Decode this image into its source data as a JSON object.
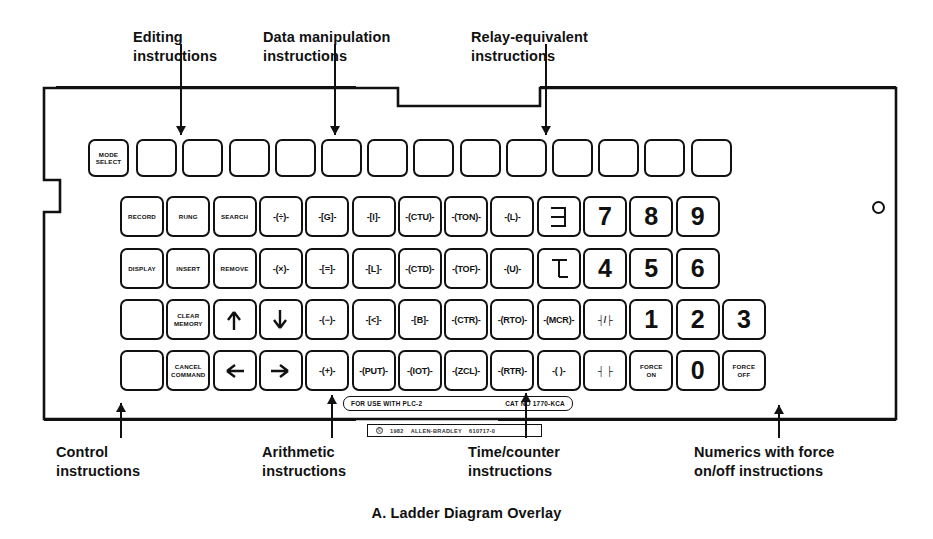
{
  "figure": {
    "caption": "A. Ladder Diagram Overlay",
    "device": "Allen-Bradley PLC-2 ladder diagram keyboard overlay"
  },
  "callouts": {
    "top": [
      {
        "id": "editing",
        "label": "Editing\ninstructions",
        "x": 133,
        "y": 28,
        "line_x": 180,
        "line_top": 44,
        "line_bottom": 135
      },
      {
        "id": "data-manipulation",
        "label": "Data manipulation\ninstructions",
        "x": 263,
        "y": 28,
        "line_x": 334,
        "line_top": 44,
        "line_bottom": 135
      },
      {
        "id": "relay-equivalent",
        "label": "Relay-equivalent\ninstructions",
        "x": 471,
        "y": 28,
        "line_x": 545,
        "line_top": 44,
        "line_bottom": 135
      }
    ],
    "bottom": [
      {
        "id": "control",
        "label": "Control\ninstructions",
        "x": 56,
        "y": 443,
        "line_x": 120,
        "line_top": 403,
        "line_bottom": 438
      },
      {
        "id": "arithmetic",
        "label": "Arithmetic\ninstructions",
        "x": 262,
        "y": 443,
        "line_x": 331,
        "line_top": 395,
        "line_bottom": 438
      },
      {
        "id": "time-counter",
        "label": "Time/counter\ninstructions",
        "x": 468,
        "y": 443,
        "line_x": 525,
        "line_top": 393,
        "line_bottom": 438
      },
      {
        "id": "numerics-force",
        "label": "Numerics with force\non/off instructions",
        "x": 694,
        "y": 443,
        "line_x": 778,
        "line_top": 405,
        "line_bottom": 438
      }
    ]
  },
  "strips": {
    "plc": "FOR USE WITH PLC-2",
    "cat": "CAT  NO  1770-KCA",
    "copyright_mark": "©",
    "copyright_year": "1982",
    "brand": "ALLEN-BRADLEY",
    "part": "610717-0"
  },
  "keyboard": {
    "rows": [
      {
        "id": "row-1",
        "keys": [
          {
            "t": "word",
            "v": "MODE\nSELECT",
            "n": "mode-select"
          },
          {
            "t": "blank",
            "v": "",
            "n": "blank-1"
          },
          {
            "t": "blank",
            "v": "",
            "n": "blank-2"
          },
          {
            "t": "blank",
            "v": "",
            "n": "blank-3"
          },
          {
            "t": "blank",
            "v": "",
            "n": "blank-4"
          },
          {
            "t": "blank",
            "v": "",
            "n": "blank-5"
          },
          {
            "t": "blank",
            "v": "",
            "n": "blank-6"
          },
          {
            "t": "blank",
            "v": "",
            "n": "blank-7"
          },
          {
            "t": "blank",
            "v": "",
            "n": "blank-8"
          },
          {
            "t": "blank",
            "v": "",
            "n": "blank-9"
          },
          {
            "t": "blank",
            "v": "",
            "n": "blank-10"
          },
          {
            "t": "blank",
            "v": "",
            "n": "blank-11"
          },
          {
            "t": "blank",
            "v": "",
            "n": "blank-12"
          },
          {
            "t": "blank",
            "v": "",
            "n": "blank-13"
          }
        ]
      },
      {
        "id": "row-2",
        "keys": [
          {
            "t": "word",
            "v": "RECORD",
            "n": "record"
          },
          {
            "t": "word",
            "v": "RUNG",
            "n": "rung"
          },
          {
            "t": "word",
            "v": "SEARCH",
            "n": "search"
          },
          {
            "t": "instr",
            "v": "-(÷)-",
            "n": "divide"
          },
          {
            "t": "instr",
            "v": "-[G]-",
            "n": "get"
          },
          {
            "t": "instr",
            "v": "-[I]-",
            "n": "input"
          },
          {
            "t": "instr",
            "v": "-(CTU)-",
            "n": "ctu"
          },
          {
            "t": "instr",
            "v": "-(TON)-",
            "n": "ton"
          },
          {
            "t": "instr",
            "v": "-(L)-",
            "n": "latch"
          },
          {
            "t": "sym",
            "v": "branch-start",
            "n": "branch-start"
          },
          {
            "t": "num",
            "v": "7",
            "n": "digit-7"
          },
          {
            "t": "num",
            "v": "8",
            "n": "digit-8"
          },
          {
            "t": "num",
            "v": "9",
            "n": "digit-9"
          }
        ]
      },
      {
        "id": "row-3",
        "keys": [
          {
            "t": "word",
            "v": "DISPLAY",
            "n": "display"
          },
          {
            "t": "word",
            "v": "INSERT",
            "n": "insert"
          },
          {
            "t": "word",
            "v": "REMOVE",
            "n": "remove"
          },
          {
            "t": "instr",
            "v": "-(×)-",
            "n": "multiply"
          },
          {
            "t": "instr",
            "v": "-[=]-",
            "n": "equal"
          },
          {
            "t": "instr",
            "v": "-[L]-",
            "n": "limit"
          },
          {
            "t": "instr",
            "v": "-(CTD)-",
            "n": "ctd"
          },
          {
            "t": "instr",
            "v": "-(TOF)-",
            "n": "tof"
          },
          {
            "t": "instr",
            "v": "-(U)-",
            "n": "unlatch"
          },
          {
            "t": "sym",
            "v": "branch-end",
            "n": "branch-end"
          },
          {
            "t": "num",
            "v": "4",
            "n": "digit-4"
          },
          {
            "t": "num",
            "v": "5",
            "n": "digit-5"
          },
          {
            "t": "num",
            "v": "6",
            "n": "digit-6"
          }
        ]
      },
      {
        "id": "row-4",
        "keys": [
          {
            "t": "blank",
            "v": "",
            "n": "blank-14"
          },
          {
            "t": "word",
            "v": "CLEAR\nMEMORY",
            "n": "clear-memory"
          },
          {
            "t": "arrow",
            "v": "up",
            "n": "arrow-up"
          },
          {
            "t": "arrow",
            "v": "down",
            "n": "arrow-down"
          },
          {
            "t": "instr",
            "v": "-(−)-",
            "n": "subtract"
          },
          {
            "t": "instr",
            "v": "-[<]-",
            "n": "less-than"
          },
          {
            "t": "instr",
            "v": "-[B]-",
            "n": "bit"
          },
          {
            "t": "instr",
            "v": "-(CTR)-",
            "n": "ctr"
          },
          {
            "t": "instr",
            "v": "-(RTO)-",
            "n": "rto"
          },
          {
            "t": "instr",
            "v": "-(MCR)-",
            "n": "mcr"
          },
          {
            "t": "instr",
            "v": "┤/├",
            "n": "contact-nc"
          },
          {
            "t": "num",
            "v": "1",
            "n": "digit-1"
          },
          {
            "t": "num",
            "v": "2",
            "n": "digit-2"
          },
          {
            "t": "num",
            "v": "3",
            "n": "digit-3"
          }
        ]
      },
      {
        "id": "row-5",
        "keys": [
          {
            "t": "blank",
            "v": "",
            "n": "blank-15"
          },
          {
            "t": "word",
            "v": "CANCEL\nCOMMAND",
            "n": "cancel-command"
          },
          {
            "t": "arrow",
            "v": "left",
            "n": "arrow-left"
          },
          {
            "t": "arrow",
            "v": "right",
            "n": "arrow-right"
          },
          {
            "t": "instr",
            "v": "-(+)-",
            "n": "add"
          },
          {
            "t": "instr",
            "v": "-(PUT)-",
            "n": "put"
          },
          {
            "t": "instr",
            "v": "-(IOT)-",
            "n": "iot"
          },
          {
            "t": "instr",
            "v": "-(ZCL)-",
            "n": "zcl"
          },
          {
            "t": "instr",
            "v": "-(RTR)-",
            "n": "rtr"
          },
          {
            "t": "instr",
            "v": "-( )-",
            "n": "output-coil"
          },
          {
            "t": "instr",
            "v": "┤ ├",
            "n": "contact-no"
          },
          {
            "t": "word",
            "v": "FORCE\nON",
            "n": "force-on"
          },
          {
            "t": "num",
            "v": "0",
            "n": "digit-0"
          },
          {
            "t": "word",
            "v": "FORCE\nOFF",
            "n": "force-off"
          }
        ]
      }
    ]
  }
}
